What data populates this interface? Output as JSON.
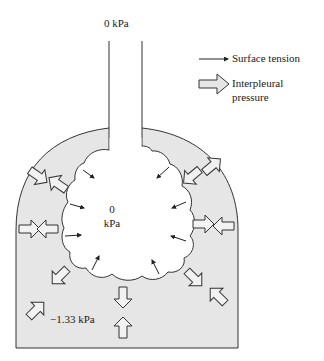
{
  "diagram": {
    "type": "lung alveolus pressure diagram",
    "labels": {
      "airway_pressure": "0  kPa",
      "alveolar_pressure_value": "0",
      "alveolar_pressure_unit": "kPa",
      "pleural_pressure": "−1.33 kPa"
    },
    "legend": {
      "items": [
        {
          "icon": "thin-arrow-icon",
          "label": "Surface tension"
        },
        {
          "icon": "hollow-arrow-icon",
          "label_line1": "Interpleural",
          "label_line2": "pressure"
        }
      ]
    },
    "colors": {
      "pleural_fill": "#e6e6e6",
      "stroke": "#333333",
      "background": "#ffffff"
    }
  }
}
